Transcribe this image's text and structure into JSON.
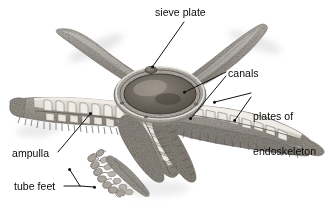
{
  "figure": {
    "style": "grayscale pencil/ink scientific illustration",
    "background_color": "#ffffff",
    "text_color": "#0a0a0a",
    "leader_line_color": "#111111",
    "body_tone_light": "#d6d2cc",
    "body_tone_mid": "#a9a49d",
    "body_tone_dark": "#6e6a64",
    "shadow_color": "#c9c9c9",
    "mouth_dark": "#4a443e"
  },
  "labels": {
    "sieve_plate": "sieve plate",
    "canals": "canals",
    "plates_of_endoskeleton_line1": "plates of",
    "plates_of_endoskeleton_line2": "endoskeleton",
    "ampulla": "ampulla",
    "tube_feet": "tube feet"
  },
  "leaders": {
    "sieve_plate": {
      "count": 1,
      "from": "label",
      "to": "madreporite on central disc"
    },
    "canals": {
      "count": 2,
      "to": "ring canal at center and radial canal in right arm"
    },
    "plates_of_endoskeleton": {
      "count": 2,
      "to": "skeletal plates along right arm"
    },
    "ampulla": {
      "count": 1,
      "to": "ampulla sac inside cutaway left arm"
    },
    "tube_feet": {
      "count": 2,
      "to": "tube feet on lower front arm"
    }
  }
}
